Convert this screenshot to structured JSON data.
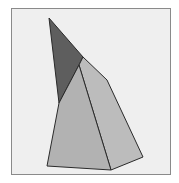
{
  "figure": {
    "type": "3d-solid-sketch",
    "colors": {
      "background": "#efefef",
      "frame": "#8a8a8a",
      "dark_face": "#5e5e5e",
      "light_face": "#b4b4b4",
      "right_face": "#bcbcbc",
      "edge": "#2a2a2a"
    },
    "vertices": {
      "apex": [
        49,
        18
      ],
      "ridge_top": [
        80,
        62
      ],
      "shoulder": [
        107,
        80
      ],
      "dark_bottom": [
        59,
        103
      ],
      "bottom_left": [
        47,
        166
      ],
      "bottom_center": [
        111,
        170
      ],
      "bottom_right": [
        143,
        157
      ]
    }
  }
}
